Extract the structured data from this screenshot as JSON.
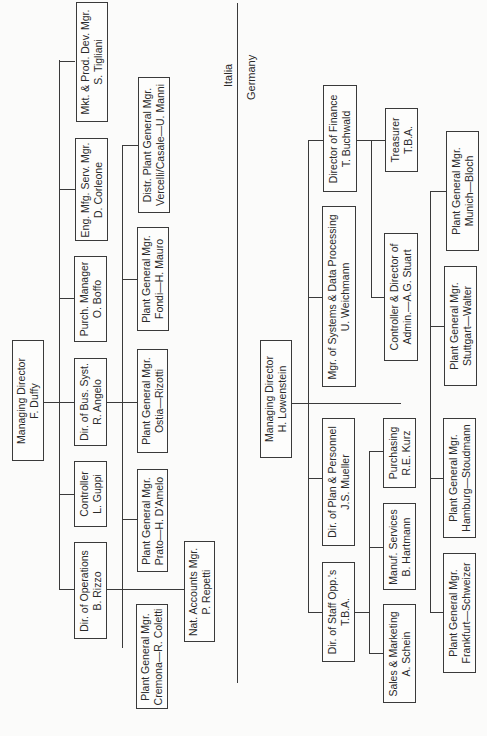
{
  "regions": {
    "italia": "Italia",
    "germany": "Germany"
  },
  "italia": {
    "managing_director": {
      "title": "Managing Director",
      "name": "F. Duffy"
    },
    "dir_operations": {
      "title": "Dir. of Operations",
      "name": "B. Rizzo"
    },
    "controller": {
      "title": "Controller",
      "name": "L. Guppi"
    },
    "dir_bus_syst": {
      "title": "Dir. of Bus. Syst.",
      "name": "R. Angelo"
    },
    "purch_manager": {
      "title": "Purch. Manager",
      "name": "O. Boffo"
    },
    "eng_mfg_serv": {
      "title": "Eng. Mfg. Serv. Mgr.",
      "name": "D. Corleone"
    },
    "mkt_prod_dev": {
      "title": "Mkt. & Prod. Dev. Mgr.",
      "name": "S. Tigliani"
    },
    "plant_cremona": {
      "title": "Plant General Mgr.",
      "name": "Cremona—R. Coletti"
    },
    "plant_prato": {
      "title": "Plant General Mgr.",
      "name": "Prato—H. D'Amelo"
    },
    "plant_ostia": {
      "title": "Plant General Mgr.",
      "name": "Ostia—Rizotti"
    },
    "plant_fondi": {
      "title": "Plant General Mgr.",
      "name": "Fondi—H. Mauro"
    },
    "distr_plant": {
      "title": "Distr. Plant General Mgr.",
      "name": "Vercelli/Casale—U. Manni"
    },
    "nat_accounts": {
      "title": "Nat. Accounts Mgr.",
      "name": "P. Repetti"
    }
  },
  "germany": {
    "managing_director": {
      "title": "Managing Director",
      "name": "H. Lowenstein"
    },
    "dir_staff_opps": {
      "title": "Dir. of Staff Opp.'s",
      "name": "T.B.A."
    },
    "dir_plan_personnel": {
      "title": "Dir. of Plan & Personnel",
      "name": "J.S. Mueller"
    },
    "mgr_systems_dp": {
      "title": "Mgr. of Systems & Data Processing",
      "name": "U. Weichmann"
    },
    "director_finance": {
      "title": "Director of Finance",
      "name": "T. Buchwald"
    },
    "sales_marketing": {
      "title": "Sales & Marketing",
      "name": "A. Schein"
    },
    "manuf_services": {
      "title": "Manuf. Services",
      "name": "B. Hartmann"
    },
    "purchasing": {
      "title": "Purchasing",
      "name": "R.E. Kurz"
    },
    "controller_admin": {
      "title": "Controller & Director of",
      "name": "Admin.—A.G. Stuart"
    },
    "treasurer": {
      "title": "Treasurer",
      "name": "T.B.A."
    },
    "plant_frankfurt": {
      "title": "Plant General Mgr.",
      "name": "Frankfurt—Schweizer"
    },
    "plant_hamburg": {
      "title": "Plant General Mgr.",
      "name": "Hamburg—Stoudmann"
    },
    "plant_stuttgart": {
      "title": "Plant General Mgr.",
      "name": "Stuttgart—Walter"
    },
    "plant_munich": {
      "title": "Plant General Mgr.",
      "name": "Munich—Bloch"
    }
  }
}
